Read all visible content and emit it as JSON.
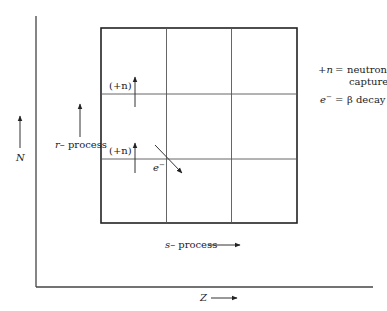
{
  "diagram": {
    "axes": {
      "x_label": "Z",
      "y_label": "N"
    },
    "grid": {
      "rows": 3,
      "cols": 3
    },
    "labels": {
      "r_process": "r-process",
      "r_process_prefix": "r",
      "r_process_suffix": "– process",
      "s_process_prefix": "s",
      "s_process_suffix": "– process",
      "neutron_capture_upper": "(+n)",
      "neutron_capture_lower": "(+n)",
      "beta_decay": "e",
      "beta_decay_sup": "−"
    },
    "legend": [
      {
        "symbol": "+n",
        "symbol_sign": "+",
        "symbol_var": "n",
        "equals": "=",
        "meaning_line1": "neutron",
        "meaning_line2": "capture"
      },
      {
        "symbol": "e⁻",
        "symbol_var": "e",
        "symbol_sup": "−",
        "equals": "=",
        "meaning_line1": "β decay"
      }
    ]
  }
}
